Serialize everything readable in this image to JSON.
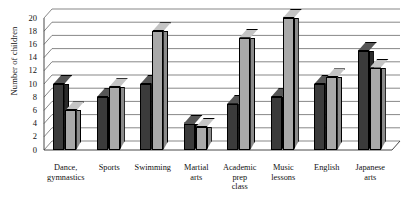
{
  "chart_data": {
    "type": "bar",
    "title": "",
    "xlabel": "",
    "ylabel": "Number of children",
    "ylim": [
      0,
      20
    ],
    "ytick_step": 2,
    "yticks": [
      0,
      2,
      4,
      6,
      8,
      10,
      12,
      14,
      16,
      18,
      20
    ],
    "grid": true,
    "legend_position": "none",
    "style": "3d-clustered-column",
    "categories": [
      "Dance, gymnastics",
      "Sports",
      "Swimming",
      "Martial arts",
      "Academic prep class",
      "Music lessons",
      "English",
      "Japanese arts"
    ],
    "category_lines": [
      [
        "Dance,",
        "gymnastics"
      ],
      [
        "Sports"
      ],
      [
        "Swimming"
      ],
      [
        "Martial",
        "arts"
      ],
      [
        "Academic",
        "prep",
        "class"
      ],
      [
        "Music",
        "lessons"
      ],
      [
        "English"
      ],
      [
        "Japanese",
        "arts"
      ]
    ],
    "series": [
      {
        "name": "Series 1",
        "color": "#3b3b3b",
        "values": [
          10,
          8,
          10,
          4,
          7,
          8,
          10,
          15
        ]
      },
      {
        "name": "Series 2",
        "color": "#a9a9a9",
        "values": [
          6,
          9.5,
          18,
          3.5,
          17,
          20,
          11,
          12.5
        ]
      }
    ]
  },
  "axis": {
    "y_title": "Number of children"
  },
  "caption": {
    "cut_off_text": ""
  }
}
